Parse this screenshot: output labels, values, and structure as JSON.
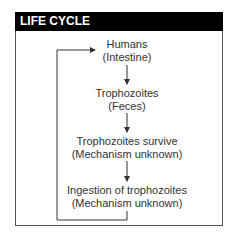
{
  "header": {
    "title": "LIFE CYCLE"
  },
  "nodes": [
    {
      "line1": "Humans",
      "line2": "(Intestine)"
    },
    {
      "line1": "Trophozoites",
      "line2": "(Feces)"
    },
    {
      "line1": "Trophozoites survive",
      "line2": "(Mechanism unknown)"
    },
    {
      "line1": "Ingestion of trophozoites",
      "line2": "(Mechanism unknown)"
    }
  ],
  "colors": {
    "header_bg": "#000000",
    "header_text": "#ffffff",
    "line": "#333333"
  }
}
